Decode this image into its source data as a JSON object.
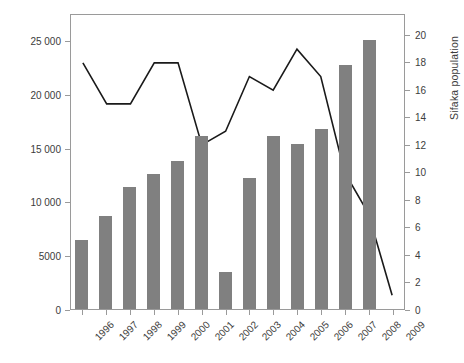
{
  "chart_data": {
    "type": "bar",
    "title": "",
    "subtitle": "",
    "xlabel": "",
    "ylabel": "Tourists",
    "y2label": "Sifaka population",
    "categories": [
      "1996",
      "1997",
      "1998",
      "1999",
      "2000",
      "2001",
      "2002",
      "2003",
      "2004",
      "2005",
      "2006",
      "2007",
      "2008",
      "2009"
    ],
    "ylim": [
      0,
      27500
    ],
    "y2lim": [
      0,
      21.5
    ],
    "yticks": [
      0,
      5000,
      10000,
      15000,
      20000,
      25000
    ],
    "ytick_labels": [
      "0",
      "5000",
      "10 000",
      "15 000",
      "20 000",
      "25 000"
    ],
    "y2ticks": [
      0,
      2,
      4,
      6,
      8,
      10,
      12,
      14,
      16,
      18,
      20
    ],
    "y2tick_labels": [
      "0",
      "2",
      "4",
      "6",
      "8",
      "10",
      "12",
      "14",
      "16",
      "18",
      "20"
    ],
    "grid": false,
    "legend": "none",
    "series": [
      {
        "name": "Tourists",
        "type": "bar",
        "axis": "left",
        "color": "#808080",
        "values": [
          6500,
          8700,
          11400,
          12600,
          13800,
          16200,
          3500,
          12300,
          16200,
          15400,
          16800,
          22800,
          25100,
          null
        ]
      },
      {
        "name": "Sifaka population",
        "type": "line",
        "axis": "right",
        "color": "#1a1a1a",
        "values": [
          18,
          15,
          15,
          18,
          18,
          12,
          13,
          17,
          16,
          19,
          17,
          10,
          7,
          1
        ]
      }
    ]
  },
  "axes": {
    "left_title": "Tourists",
    "right_title": "Sifaka population"
  }
}
